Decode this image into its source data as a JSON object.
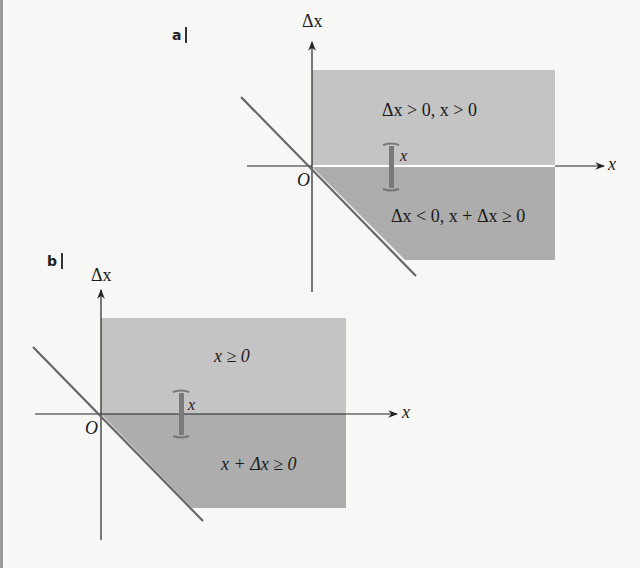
{
  "colors": {
    "background": "#f7f7f5",
    "region_upper": "#c4c4c4",
    "region_lower": "#adadad",
    "axis": "#222222",
    "diagonal": "#666666",
    "bracket": "#777777"
  },
  "panel_a": {
    "tag": "a",
    "y_axis_label": "Δx",
    "x_axis_label": "x",
    "origin_label": "O",
    "region_upper_label": "Δx > 0, x > 0",
    "region_lower_label": "Δx < 0, x + Δx ≥ 0",
    "bracket_label": "x"
  },
  "panel_b": {
    "tag": "b",
    "y_axis_label": "Δx",
    "x_axis_label": "x",
    "origin_label": "O",
    "region_upper_label": "x ≥ 0",
    "region_lower_label": "x + Δx ≥ 0",
    "bracket_label": "x"
  }
}
